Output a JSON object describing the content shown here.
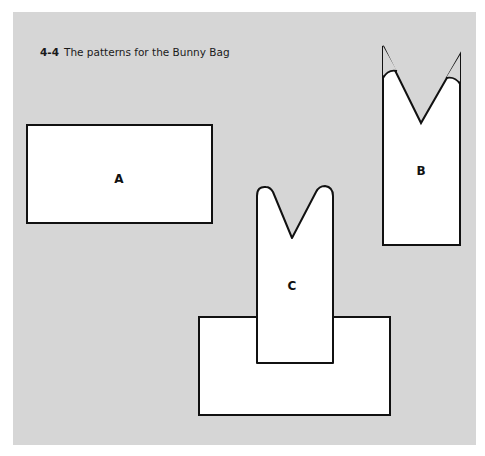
{
  "caption": {
    "number": "4-4",
    "text": "The patterns for the Bunny Bag"
  },
  "pieces": [
    {
      "id": "A",
      "label": "A",
      "shape": "rectangle"
    },
    {
      "id": "B",
      "label": "B",
      "shape": "ears-pointed"
    },
    {
      "id": "C",
      "label": "C",
      "shape": "ears-rounded-with-base"
    }
  ],
  "colors": {
    "background": "#d6d6d6",
    "piece_fill": "#ffffff",
    "outline": "#111111"
  }
}
